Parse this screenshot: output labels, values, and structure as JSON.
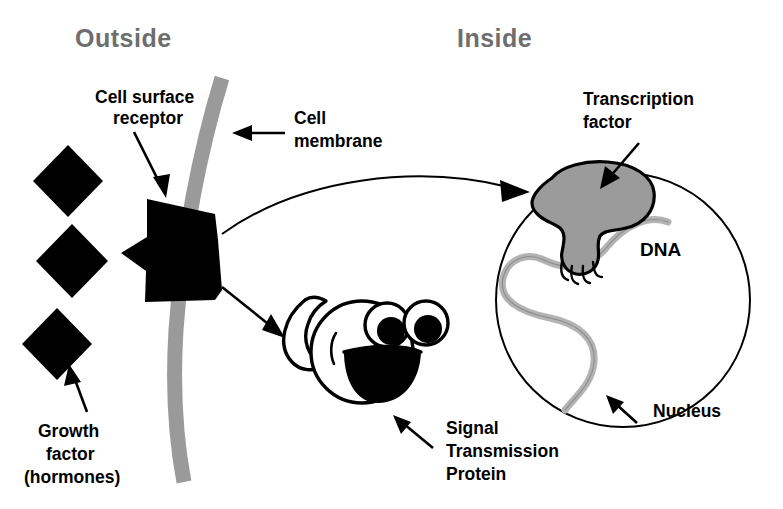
{
  "figure": {
    "background_color": "#ffffff"
  },
  "headers": {
    "outside": "Outside",
    "inside": "Inside",
    "header_color": "#6e6e6e"
  },
  "labels": {
    "cell_surface_receptor": "Cell surface\nreceptor",
    "cell_surface_receptor_line1": "Cell surface",
    "cell_surface_receptor_line2": "receptor",
    "cell_membrane_line1": "Cell",
    "cell_membrane_line2": "membrane",
    "transcription_factor_line1": "Transcription",
    "transcription_factor_line2": "factor",
    "dna": "DNA",
    "nucleus": "Nucleus",
    "growth_factor_line1": "Growth",
    "growth_factor_line2": "factor",
    "growth_factor_line3": "(hormones)",
    "signal_protein_line1": "Signal",
    "signal_protein_line2": "Transmission",
    "signal_protein_line3": "Protein"
  },
  "colors": {
    "membrane_gray": "#9a9a9a",
    "transcription_factor_gray": "#9b9b9b",
    "dna_gray": "#b3b3b3",
    "ink_black": "#000000",
    "header_gray": "#6e6e6e",
    "paper_white": "#ffffff"
  },
  "elements": {
    "growth_factor_count": 3,
    "receptor_shape": "notched-black-polygon",
    "transcription_factor_shape": "gray-blob-with-gripping-hand",
    "signal_protein_shape": "cartoon-face-with-two-eyes-and-open-mouth",
    "nucleus_shape": "circle-outline",
    "membrane_shape": "curved-gray-band",
    "dna_shape": "wavy-gray-strand"
  }
}
